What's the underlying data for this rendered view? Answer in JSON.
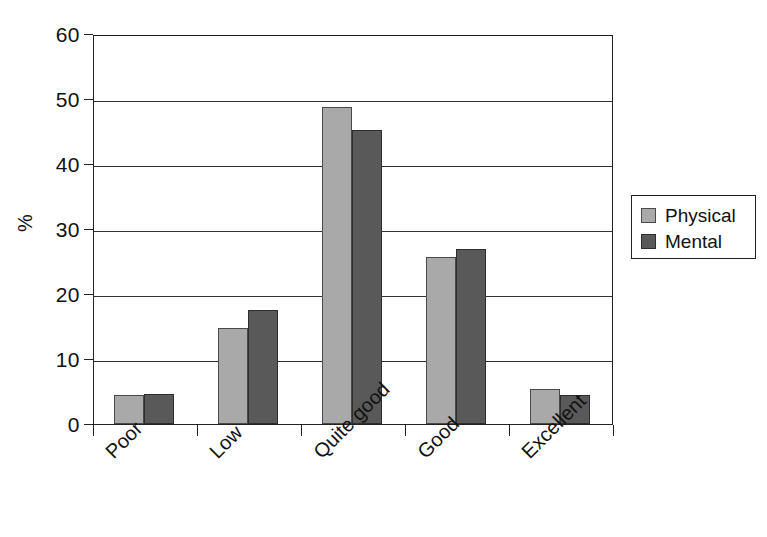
{
  "chart_data": {
    "type": "bar",
    "title": "",
    "subtitle": "",
    "xlabel": "",
    "ylabel": "%",
    "ylim": [
      0,
      60
    ],
    "ytick_step": 10,
    "yticks": [
      60,
      50,
      40,
      30,
      20,
      10,
      0
    ],
    "grid": true,
    "legend_position": "right",
    "categories": [
      "Poor",
      "Low",
      "Quite good",
      "Good",
      "Excellent"
    ],
    "series": [
      {
        "name": "Physical",
        "color": "#a9a9a9",
        "values": [
          4.5,
          14.7,
          48.8,
          25.7,
          5.4
        ]
      },
      {
        "name": "Mental",
        "color": "#595959",
        "values": [
          4.6,
          17.5,
          45.2,
          26.9,
          4.5
        ]
      }
    ]
  },
  "legend": {
    "items": [
      {
        "label": "Physical",
        "color": "#a9a9a9"
      },
      {
        "label": "Mental",
        "color": "#595959"
      }
    ]
  },
  "axis": {
    "y_title": "%",
    "y_tick_labels": [
      "60",
      "50",
      "40",
      "30",
      "20",
      "10",
      "0"
    ],
    "x_tick_labels": [
      "Poor",
      "Low",
      "Quite good",
      "Good",
      "Excellent"
    ]
  },
  "colors": {
    "series_physical": "#a9a9a9",
    "series_mental": "#595959",
    "axis": "#222222",
    "grid": "#333333",
    "background": "#ffffff"
  }
}
